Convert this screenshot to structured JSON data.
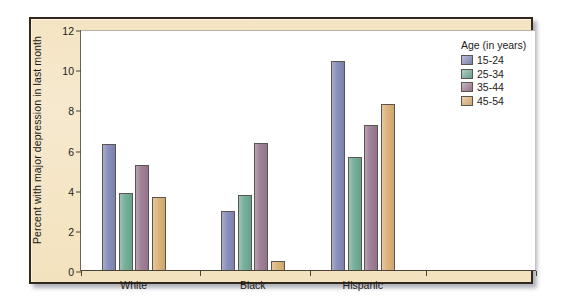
{
  "chart_data": {
    "type": "bar",
    "title": "",
    "xlabel": "",
    "ylabel": "Percent with major depression in last month",
    "ylim": [
      0,
      12
    ],
    "yticks": [
      0,
      2,
      4,
      6,
      8,
      10,
      12
    ],
    "grid": false,
    "legend_position": "top-right",
    "legend_title": "Age (in years)",
    "categories": [
      "White",
      "Black",
      "Hispanic"
    ],
    "series": [
      {
        "name": "15-24",
        "color": "#8389b8",
        "values": [
          6.3,
          3.0,
          10.45
        ]
      },
      {
        "name": "25-34",
        "color": "#6fab96",
        "values": [
          3.9,
          3.8,
          5.7
        ]
      },
      {
        "name": "35-44",
        "color": "#9b7a92",
        "values": [
          5.3,
          6.35,
          7.25
        ]
      },
      {
        "name": "45-54",
        "color": "#dbb075",
        "values": [
          3.7,
          0.5,
          8.3
        ]
      }
    ]
  },
  "legend": {
    "title": "Age (in years)",
    "items": [
      {
        "label": "15-24",
        "color": "#8389b8"
      },
      {
        "label": "25-34",
        "color": "#6fab96"
      },
      {
        "label": "35-44",
        "color": "#9b7a92"
      },
      {
        "label": "45-54",
        "color": "#dbb075"
      }
    ]
  },
  "axes": {
    "y_title": "Percent with major depression in last month",
    "y_tick_labels": [
      "0",
      "2",
      "4",
      "6",
      "8",
      "10",
      "12"
    ],
    "x_group_labels": [
      "White",
      "Black",
      "Hispanic"
    ]
  },
  "colors": {
    "panel_background": "#f4e4c3",
    "panel_border": "#30281d",
    "plot_background": "#ffffff",
    "axis": "#4a4338",
    "text": "#1d1b17"
  }
}
